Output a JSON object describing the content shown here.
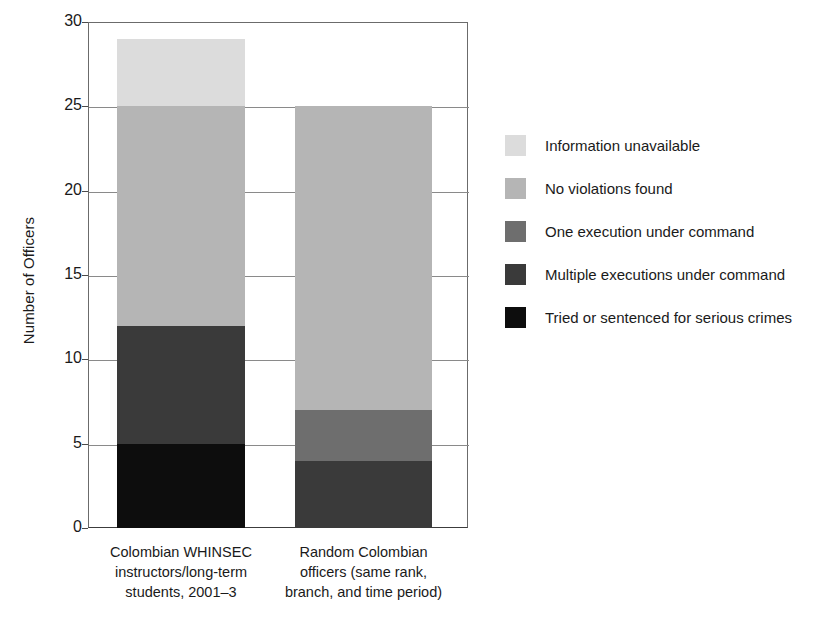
{
  "chart_data": {
    "type": "bar",
    "stacked": true,
    "title": "",
    "xlabel": "",
    "ylabel": "Number of Officers",
    "ylim": [
      0,
      30
    ],
    "ytick_step": 5,
    "yticks": [
      0,
      5,
      10,
      15,
      20,
      25,
      30
    ],
    "ytick_labels": [
      "0",
      "5",
      "10",
      "15",
      "20",
      "25",
      "30"
    ],
    "grid": true,
    "legend_position": "right",
    "categories": [
      "Colombian WHINSEC instructors/long-term students, 2001–3",
      "Random Colombian officers (same rank, branch, and time period)"
    ],
    "category_lines": [
      [
        "Colombian WHINSEC",
        "instructors/long-term",
        "students, 2001–3"
      ],
      [
        "Random Colombian",
        "officers (same rank,",
        "branch, and time period)"
      ]
    ],
    "series": [
      {
        "name": "Tried or sentenced for serious crimes",
        "color": "#0d0d0d",
        "values": [
          5,
          0
        ]
      },
      {
        "name": "Multiple executions under command",
        "color": "#3a3a3a",
        "values": [
          7,
          4
        ]
      },
      {
        "name": "One execution under command",
        "color": "#6e6e6e",
        "values": [
          0,
          3
        ]
      },
      {
        "name": "No violations found",
        "color": "#b5b5b5",
        "values": [
          13,
          18
        ]
      },
      {
        "name": "Information unavailable",
        "color": "#dcdcdc",
        "values": [
          4,
          0
        ]
      }
    ],
    "totals": [
      29,
      25
    ],
    "legend_order_top_to_bottom": [
      "Information unavailable",
      "No violations found",
      "One execution under command",
      "Multiple executions under command",
      "Tried or sentenced for serious crimes"
    ],
    "legend_entries": [
      {
        "label": "Information unavailable",
        "color": "#dcdcdc"
      },
      {
        "label": "No violations found",
        "color": "#b5b5b5"
      },
      {
        "label": "One execution under command",
        "color": "#6e6e6e"
      },
      {
        "label": "Multiple executions under command",
        "color": "#3a3a3a"
      },
      {
        "label": "Tried or sentenced for serious crimes",
        "color": "#0d0d0d"
      }
    ]
  }
}
